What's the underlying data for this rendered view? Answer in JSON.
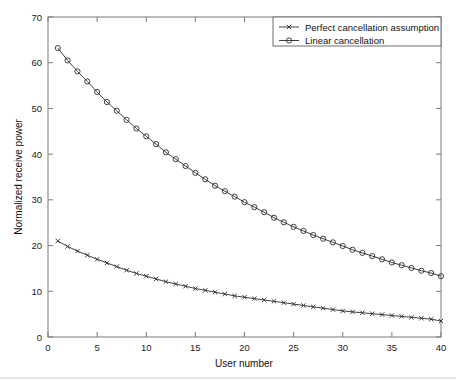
{
  "chart_data": {
    "type": "line",
    "title": "",
    "xlabel": "User number",
    "ylabel": "Normalized receive power",
    "xlim": [
      0,
      40
    ],
    "ylim": [
      0,
      70
    ],
    "xticks": [
      0,
      5,
      10,
      15,
      20,
      25,
      30,
      35,
      40
    ],
    "yticks": [
      0,
      10,
      20,
      30,
      40,
      50,
      60,
      70
    ],
    "grid": false,
    "legend_position": "top-right",
    "x": [
      1,
      2,
      3,
      4,
      5,
      6,
      7,
      8,
      9,
      10,
      11,
      12,
      13,
      14,
      15,
      16,
      17,
      18,
      19,
      20,
      21,
      22,
      23,
      24,
      25,
      26,
      27,
      28,
      29,
      30,
      31,
      32,
      33,
      34,
      35,
      36,
      37,
      38,
      39,
      40
    ],
    "series": [
      {
        "name": "Perfect cancellation assumption",
        "marker": "x",
        "color": "#2b2b2b",
        "values": [
          21.0,
          19.8,
          18.8,
          17.9,
          17.0,
          16.2,
          15.4,
          14.6,
          13.9,
          13.3,
          12.7,
          12.1,
          11.6,
          11.1,
          10.6,
          10.2,
          9.8,
          9.4,
          9.0,
          8.7,
          8.4,
          8.1,
          7.8,
          7.5,
          7.2,
          6.9,
          6.6,
          6.3,
          6.0,
          5.7,
          5.5,
          5.3,
          5.1,
          4.9,
          4.7,
          4.5,
          4.3,
          4.1,
          3.9,
          3.5
        ]
      },
      {
        "name": "Linear cancellation",
        "marker": "o",
        "color": "#2b2b2b",
        "values": [
          63.2,
          60.5,
          58.1,
          55.9,
          53.6,
          51.4,
          49.5,
          47.5,
          45.6,
          43.9,
          42.2,
          40.4,
          38.9,
          37.4,
          35.9,
          34.5,
          33.1,
          31.9,
          30.7,
          29.5,
          28.4,
          27.3,
          26.1,
          25.1,
          24.1,
          23.2,
          22.3,
          21.5,
          20.7,
          19.9,
          19.1,
          18.4,
          17.7,
          17.0,
          16.3,
          15.7,
          15.1,
          14.5,
          14.0,
          13.3
        ]
      }
    ]
  },
  "legend": {
    "entries": [
      {
        "label": "Perfect cancellation assumption",
        "marker": "x-marker-icon"
      },
      {
        "label": "Linear cancellation",
        "marker": "circle-marker-icon"
      }
    ]
  },
  "axes": {
    "x_title": "User number",
    "y_title": "Normalized receive power",
    "x_tick_labels": [
      "0",
      "5",
      "10",
      "15",
      "20",
      "25",
      "30",
      "35",
      "40"
    ],
    "y_tick_labels": [
      "0",
      "10",
      "20",
      "30",
      "40",
      "50",
      "60",
      "70"
    ]
  },
  "colors": {
    "ink": "#2b2b2b",
    "axis": "#7a7a7a",
    "background": "#ffffff"
  }
}
